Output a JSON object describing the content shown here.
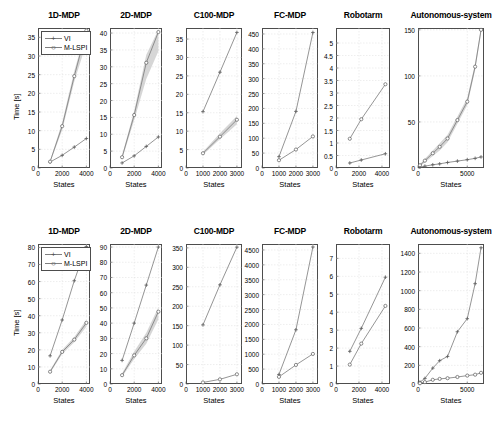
{
  "figure": {
    "axis_labels": {
      "y": "Time [s]",
      "x": "States"
    },
    "legend": [
      {
        "label": "VI",
        "marker": "plus",
        "color": "#808080"
      },
      {
        "label": "M-LSPI",
        "marker": "circle",
        "color": "#808080"
      }
    ]
  },
  "chart_data": [
    {
      "type": "line",
      "title": "1D-MDP",
      "row": 1,
      "xlabel": "States",
      "ylabel": "Time [s]",
      "xlim": [
        0,
        4300
      ],
      "ylim": [
        0,
        37.5
      ],
      "xticks": [
        0,
        2000,
        4000
      ],
      "yticks": [
        0,
        5,
        10,
        15,
        20,
        25,
        30,
        35
      ],
      "grid": true,
      "legend": "top-left",
      "x": [
        1000,
        2000,
        3000,
        4000
      ],
      "series": [
        {
          "name": "VI",
          "values": [
            1.6,
            3.4,
            5.6,
            7.9
          ]
        },
        {
          "name": "M-LSPI",
          "values": [
            1.7,
            11.2,
            24.6,
            36.8
          ],
          "band": [
            [
              1.4,
              2.0
            ],
            [
              10.2,
              12.2
            ],
            [
              23.2,
              26.0
            ],
            [
              33.4,
              37.2
            ]
          ]
        }
      ]
    },
    {
      "type": "line",
      "title": "2D-MDP",
      "row": 1,
      "xlabel": "States",
      "ylabel": "",
      "xlim": [
        0,
        4300
      ],
      "ylim": [
        0,
        41.5
      ],
      "xticks": [
        0,
        2000,
        4000
      ],
      "yticks": [
        0,
        5,
        10,
        15,
        20,
        25,
        30,
        35,
        40
      ],
      "grid": true,
      "x": [
        1000,
        2000,
        3000,
        4000
      ],
      "series": [
        {
          "name": "VI",
          "values": [
            1.5,
            3.6,
            6.4,
            9.2
          ]
        },
        {
          "name": "M-LSPI",
          "values": [
            3.2,
            15.7,
            31.2,
            40.3
          ],
          "band": [
            [
              2.6,
              3.8
            ],
            [
              14.2,
              17.0
            ],
            [
              26.4,
              33.6
            ],
            [
              34.6,
              41.0
            ]
          ]
        }
      ]
    },
    {
      "type": "line",
      "title": "C100-MDP",
      "row": 1,
      "xlabel": "States",
      "ylabel": "",
      "xlim": [
        0,
        3300
      ],
      "ylim": [
        0,
        38
      ],
      "xticks": [
        0,
        1000,
        2000,
        3000
      ],
      "yticks": [
        0,
        5,
        10,
        15,
        20,
        25,
        30,
        35
      ],
      "grid": true,
      "x": [
        1000,
        2000,
        3000
      ],
      "series": [
        {
          "name": "VI",
          "values": [
            15.3,
            26.0,
            36.8
          ]
        },
        {
          "name": "M-LSPI",
          "values": [
            4.0,
            8.5,
            13.1
          ],
          "band": [
            [
              3.6,
              4.4
            ],
            [
              7.8,
              9.4
            ],
            [
              11.9,
              14.1
            ]
          ]
        }
      ]
    },
    {
      "type": "line",
      "title": "FC-MDP",
      "row": 1,
      "xlabel": "States",
      "ylabel": "",
      "xlim": [
        0,
        3300
      ],
      "ylim": [
        0,
        470
      ],
      "xticks": [
        0,
        1000,
        2000,
        3000
      ],
      "yticks": [
        0,
        50,
        100,
        150,
        200,
        250,
        300,
        350,
        400,
        450
      ],
      "grid": true,
      "x": [
        1000,
        2000,
        3000
      ],
      "series": [
        {
          "name": "VI",
          "values": [
            38,
            190,
            455
          ]
        },
        {
          "name": "M-LSPI",
          "values": [
            26,
            62,
            106
          ]
        }
      ]
    },
    {
      "type": "line",
      "title": "Robotarm",
      "row": 1,
      "xlabel": "States",
      "ylabel": "",
      "xlim": [
        0,
        4700
      ],
      "ylim": [
        0,
        5.6
      ],
      "xticks": [
        0,
        2000,
        4000
      ],
      "yticks": [
        0,
        0.5,
        1,
        1.5,
        2,
        2.5,
        3,
        3.5,
        4,
        4.5,
        5
      ],
      "grid": true,
      "x": [
        1200,
        2200,
        4300
      ],
      "series": [
        {
          "name": "VI",
          "values": [
            0.2,
            0.32,
            0.57
          ]
        },
        {
          "name": "M-LSPI",
          "values": [
            1.17,
            1.95,
            3.35
          ]
        }
      ]
    },
    {
      "type": "line",
      "title": "Autonomous-system",
      "row": 1,
      "xlabel": "States",
      "ylabel": "",
      "xlim": [
        0,
        6700
      ],
      "ylim": [
        0,
        152
      ],
      "xticks": [
        0,
        5000
      ],
      "yticks": [
        0,
        50,
        100,
        150
      ],
      "grid": true,
      "x": [
        200,
        700,
        1500,
        2200,
        3000,
        4000,
        5000,
        5800,
        6400
      ],
      "series": [
        {
          "name": "VI",
          "values": [
            1,
            2,
            3.5,
            4.5,
            6,
            7.5,
            9,
            10.5,
            12
          ]
        },
        {
          "name": "M-LSPI",
          "values": [
            3,
            8,
            16,
            23,
            32,
            52,
            72,
            110,
            150
          ],
          "band": [
            [
              2,
              4
            ],
            [
              6,
              10
            ],
            [
              13,
              19
            ],
            [
              19,
              27
            ],
            [
              28,
              36
            ],
            [
              48,
              56
            ],
            [
              68,
              76
            ],
            [
              106,
              114
            ],
            [
              146,
              152
            ]
          ]
        }
      ]
    },
    {
      "type": "line",
      "title": "1D-MDP",
      "row": 2,
      "xlabel": "States",
      "ylabel": "Time [s]",
      "xlim": [
        0,
        4300
      ],
      "ylim": [
        0,
        82
      ],
      "xticks": [
        0,
        2000,
        4000
      ],
      "yticks": [
        0,
        10,
        20,
        30,
        40,
        50,
        60,
        70,
        80
      ],
      "grid": true,
      "legend": "top-left",
      "x": [
        1000,
        2000,
        3000,
        4000
      ],
      "series": [
        {
          "name": "VI",
          "values": [
            16.5,
            37.5,
            60.5,
            80.5
          ]
        },
        {
          "name": "M-LSPI",
          "values": [
            7.2,
            18.8,
            26.0,
            35.8
          ],
          "band": [
            [
              6.4,
              8.0
            ],
            [
              17.6,
              20.0
            ],
            [
              24.4,
              27.6
            ],
            [
              33.6,
              37.6
            ]
          ]
        }
      ]
    },
    {
      "type": "line",
      "title": "2D-MDP",
      "row": 2,
      "xlabel": "States",
      "ylabel": "",
      "xlim": [
        0,
        4300
      ],
      "ylim": [
        0,
        92
      ],
      "xticks": [
        0,
        2000,
        4000
      ],
      "yticks": [
        0,
        10,
        20,
        30,
        40,
        50,
        60,
        70,
        80,
        90
      ],
      "grid": true,
      "x": [
        1000,
        2000,
        3000,
        4000
      ],
      "series": [
        {
          "name": "VI",
          "values": [
            15.5,
            40,
            65,
            90
          ]
        },
        {
          "name": "M-LSPI",
          "values": [
            5.8,
            18.8,
            30.0,
            47.5
          ],
          "band": [
            [
              4.8,
              7.0
            ],
            [
              16.4,
              21.4
            ],
            [
              26.4,
              33.6
            ],
            [
              42.5,
              50.5
            ]
          ]
        }
      ]
    },
    {
      "type": "line",
      "title": "C100-MDP",
      "row": 2,
      "xlabel": "States",
      "ylabel": "",
      "xlim": [
        0,
        3300
      ],
      "ylim": [
        0,
        360
      ],
      "xticks": [
        0,
        1000,
        2000,
        3000
      ],
      "yticks": [
        0,
        50,
        100,
        150,
        200,
        250,
        300,
        350
      ],
      "grid": true,
      "x": [
        1000,
        2000,
        3000
      ],
      "series": [
        {
          "name": "VI",
          "values": [
            152,
            255,
            352
          ]
        },
        {
          "name": "M-LSPI",
          "values": [
            4,
            12,
            25
          ]
        }
      ]
    },
    {
      "type": "line",
      "title": "FC-MDP",
      "row": 2,
      "xlabel": "States",
      "ylabel": "",
      "xlim": [
        0,
        3300
      ],
      "ylim": [
        0,
        4700
      ],
      "xticks": [
        0,
        1000,
        2000,
        3000
      ],
      "yticks": [
        0,
        500,
        1000,
        1500,
        2000,
        2500,
        3000,
        3500,
        4000,
        4500
      ],
      "grid": true,
      "x": [
        1000,
        2000,
        3000
      ],
      "series": [
        {
          "name": "VI",
          "values": [
            320,
            1820,
            4600
          ]
        },
        {
          "name": "M-LSPI",
          "values": [
            240,
            640,
            1010
          ]
        }
      ]
    },
    {
      "type": "line",
      "title": "Robotarm",
      "row": 2,
      "xlabel": "States",
      "ylabel": "",
      "xlim": [
        0,
        4700
      ],
      "ylim": [
        0,
        7.8
      ],
      "xticks": [
        0,
        2000,
        4000
      ],
      "yticks": [
        0,
        1,
        2,
        3,
        4,
        5,
        6,
        7
      ],
      "grid": true,
      "x": [
        1200,
        2200,
        4300
      ],
      "series": [
        {
          "name": "VI",
          "values": [
            1.82,
            3.1,
            5.95
          ]
        },
        {
          "name": "M-LSPI",
          "values": [
            1.08,
            2.25,
            4.35
          ]
        }
      ]
    },
    {
      "type": "line",
      "title": "Autonomous-system",
      "row": 2,
      "xlabel": "States",
      "ylabel": "",
      "xlim": [
        0,
        6700
      ],
      "ylim": [
        0,
        1500
      ],
      "xticks": [
        0,
        5000
      ],
      "yticks": [
        0,
        200,
        400,
        600,
        800,
        1000,
        1200,
        1400
      ],
      "grid": true,
      "x": [
        200,
        700,
        1500,
        2200,
        3000,
        4000,
        5000,
        5800,
        6400
      ],
      "series": [
        {
          "name": "VI",
          "values": [
            20,
            60,
            170,
            250,
            295,
            560,
            700,
            1075,
            1460
          ]
        },
        {
          "name": "M-LSPI",
          "values": [
            8,
            20,
            45,
            55,
            62,
            75,
            90,
            100,
            120
          ]
        }
      ]
    }
  ]
}
